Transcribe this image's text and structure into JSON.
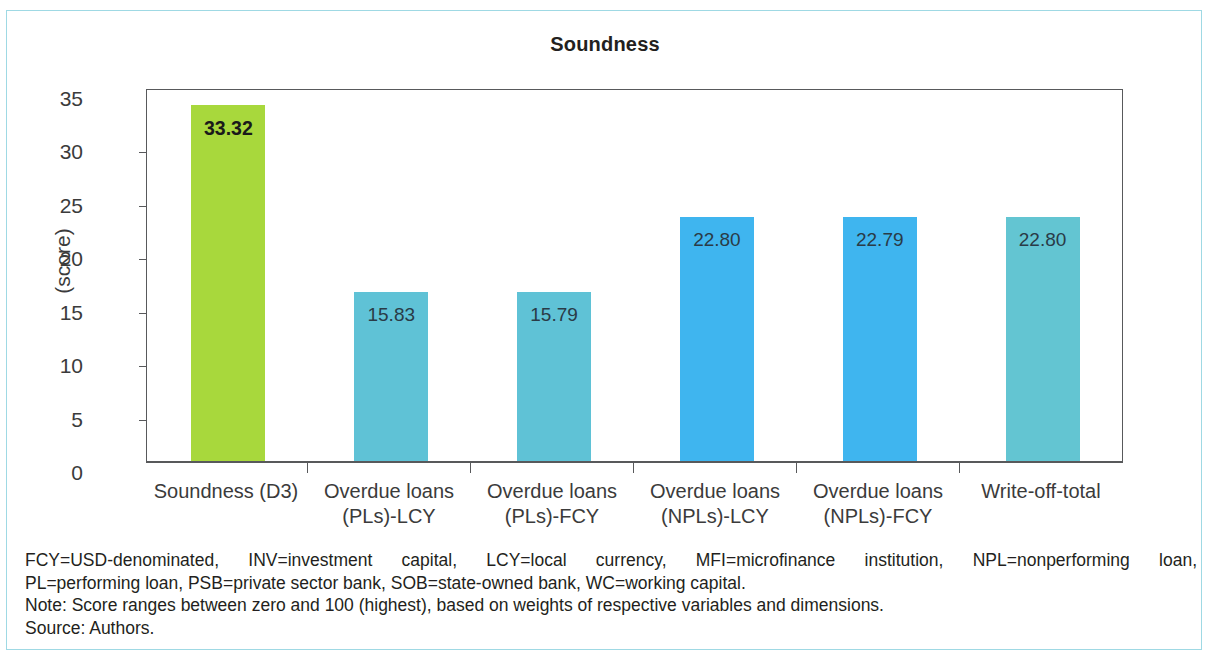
{
  "figure": {
    "title": "Soundness",
    "y_axis_label": "(score)"
  },
  "chart_data": {
    "type": "bar",
    "title": "Soundness",
    "xlabel": "",
    "ylabel": "(score)",
    "ylim": [
      0,
      35
    ],
    "yticks": [
      0,
      5,
      10,
      15,
      20,
      25,
      30,
      35
    ],
    "grid": false,
    "legend": "none",
    "categories": [
      "Soundness (D3)",
      "Overdue loans (PLs)-LCY",
      "Overdue loans (PLs)-FCY",
      "Overdue loans (NPLs)-LCY",
      "Overdue loans (NPLs)-FCY",
      "Write-off-total"
    ],
    "category_lines": [
      [
        "Soundness (D3)",
        ""
      ],
      [
        "Overdue loans",
        "(PLs)-LCY"
      ],
      [
        "Overdue loans",
        "(PLs)-FCY"
      ],
      [
        "Overdue loans",
        "(NPLs)-LCY"
      ],
      [
        "Overdue loans",
        "(NPLs)-FCY"
      ],
      [
        "Write-off-total",
        ""
      ]
    ],
    "values": [
      33.32,
      15.83,
      15.79,
      22.8,
      22.79,
      22.8
    ],
    "value_labels": [
      "33.32",
      "15.83",
      "15.79",
      "22.80",
      "22.79",
      "22.80"
    ],
    "bar_colors": [
      "#a8d83c",
      "#5fc2d6",
      "#5fc2d6",
      "#3fb5ef",
      "#3fb5ef",
      "#63c5d2"
    ]
  },
  "notes": {
    "line1": "FCY=USD-denominated, INV=investment capital, LCY=local currency, MFI=microfinance institution, NPL=nonperforming loan,",
    "line2": "PL=performing loan, PSB=private sector bank, SOB=state-owned bank, WC=working capital.",
    "line3": "Note: Score ranges between zero and 100 (highest), based on weights of respective variables and dimensions.",
    "line4": "Source: Authors."
  }
}
